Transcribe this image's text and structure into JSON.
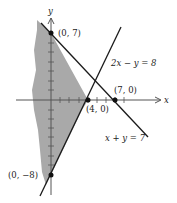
{
  "diagram": {
    "axes": {
      "x_label": "x",
      "y_label": "y"
    },
    "lines": [
      {
        "equation": "2x − y = 8",
        "label": "2x − y = 8"
      },
      {
        "equation": "x + y = 7",
        "label": "x + y = 7"
      }
    ],
    "points": [
      {
        "label": "(0, 7)",
        "x": 0,
        "y": 7
      },
      {
        "label": "(7, 0)",
        "x": 7,
        "y": 0
      },
      {
        "label": "(4, 0)",
        "x": 4,
        "y": 0
      },
      {
        "label": "(0, −8)",
        "x": 0,
        "y": -8
      }
    ],
    "colors": {
      "shade": "#a9a9a9",
      "line": "#1a1a1a",
      "axis": "#555555"
    }
  }
}
